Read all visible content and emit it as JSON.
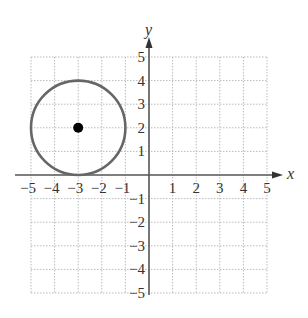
{
  "chart_data": {
    "type": "scatter",
    "title": "",
    "xlabel": "x",
    "ylabel": "y",
    "xlim": [
      -5,
      5
    ],
    "ylim": [
      -5,
      5
    ],
    "grid": true,
    "grid_style": "dotted",
    "x_ticks": [
      -5,
      -4,
      -3,
      -2,
      -1,
      1,
      2,
      3,
      4,
      5
    ],
    "y_ticks": [
      5,
      4,
      3,
      2,
      1,
      -1,
      -2,
      -3,
      -4,
      -5
    ],
    "x_tick_labels": [
      "−5",
      "−4",
      "−3",
      "−2",
      "−1",
      "1",
      "2",
      "3",
      "4",
      "5"
    ],
    "y_tick_labels": [
      "5",
      "4",
      "3",
      "2",
      "1",
      "−1",
      "−2",
      "−3",
      "−4",
      "−5"
    ],
    "shapes": [
      {
        "kind": "circle",
        "center": [
          -3,
          2
        ],
        "radius": 2,
        "color": "#666666"
      }
    ],
    "points": [
      {
        "x": -3,
        "y": 2,
        "label": "center",
        "color": "#000000"
      }
    ],
    "legend": null
  },
  "colors": {
    "axis": "#555555",
    "grid": "#bbbbbb",
    "circle": "#666666",
    "center_point": "#000000"
  },
  "labels": {
    "x_axis": "x",
    "y_axis": "y"
  }
}
